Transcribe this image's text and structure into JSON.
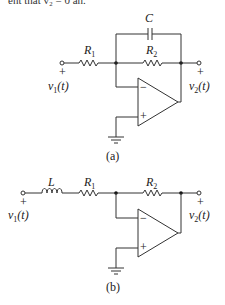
{
  "header_fragment": "ent that v₂ = 0 an.",
  "circuit_a": {
    "caption": "(a)",
    "capacitor": "C",
    "r1": "R",
    "r1_sub": "1",
    "r2": "R",
    "r2_sub": "2",
    "input": "v",
    "input_sub": "1",
    "input_arg": "(t)",
    "output": "v",
    "output_sub": "2",
    "output_arg": "(t)",
    "plus": "+",
    "minus": "−"
  },
  "circuit_b": {
    "caption": "(b)",
    "inductor": "L",
    "r1": "R",
    "r1_sub": "1",
    "r2": "R",
    "r2_sub": "2",
    "input": "v",
    "input_sub": "1",
    "input_arg": "(t)",
    "output": "v",
    "output_sub": "2",
    "output_arg": "(t)",
    "plus": "+",
    "minus": "−"
  }
}
